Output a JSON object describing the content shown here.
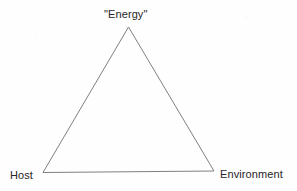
{
  "diagram": {
    "type": "triangle-concept-diagram",
    "background_color": "#fefefe",
    "line_color": "#808080",
    "line_width": 1,
    "text_color": "#262626",
    "fill": "none",
    "vertices": [
      {
        "id": "apex",
        "label": "\"Energy\"",
        "x": 128.5,
        "y": 27.0
      },
      {
        "id": "bottom-left",
        "label": "Host",
        "x": 43.0,
        "y": 172.5
      },
      {
        "id": "bottom-right",
        "label": "Environment",
        "x": 214.0,
        "y": 171.0
      }
    ],
    "edges": [
      {
        "id": "left-edge",
        "from": "apex",
        "to": "bottom-left"
      },
      {
        "id": "right-edge",
        "from": "apex",
        "to": "bottom-right"
      },
      {
        "id": "bottom-edge",
        "from": "bottom-left",
        "to": "bottom-right"
      }
    ],
    "labels": {
      "apex": "\"Energy\"",
      "bottom_left": "Host",
      "bottom_right": "Environment"
    }
  }
}
